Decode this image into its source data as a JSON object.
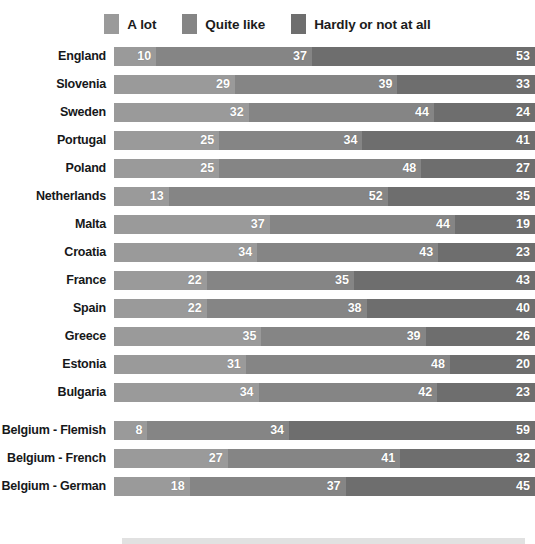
{
  "chart_data": {
    "type": "bar",
    "orientation": "horizontal",
    "stacked": true,
    "percent": true,
    "title": "",
    "subtitle": "",
    "xlabel": "",
    "ylabel": "",
    "xlim": [
      0,
      100
    ],
    "grid": false,
    "legend_position": "top-center",
    "series": [
      {
        "name": "A lot",
        "color": "#9a9a9a",
        "values": [
          10,
          29,
          32,
          25,
          25,
          13,
          37,
          34,
          22,
          22,
          35,
          31,
          34,
          8,
          27,
          18
        ]
      },
      {
        "name": "Quite like",
        "color": "#858585",
        "values": [
          37,
          39,
          44,
          34,
          48,
          52,
          44,
          43,
          35,
          38,
          39,
          48,
          42,
          34,
          41,
          37
        ]
      },
      {
        "name": "Hardly or not at all",
        "color": "#6e6e6e",
        "values": [
          53,
          33,
          24,
          41,
          27,
          35,
          19,
          23,
          43,
          40,
          26,
          20,
          23,
          59,
          32,
          45
        ]
      }
    ],
    "categories": [
      "England",
      "Slovenia",
      "Sweden",
      "Portugal",
      "Poland",
      "Netherlands",
      "Malta",
      "Croatia",
      "France",
      "Spain",
      "Greece",
      "Estonia",
      "Bulgaria",
      "Belgium - Flemish",
      "Belgium - French",
      "Belgium - German"
    ]
  },
  "legend": {
    "items": [
      {
        "label": "A lot",
        "color": "#9a9a9a",
        "swatch_name": "legend-swatch-a-lot"
      },
      {
        "label": "Quite like",
        "color": "#858585",
        "swatch_name": "legend-swatch-quite-like"
      },
      {
        "label": "Hardly or not at all",
        "color": "#6e6e6e",
        "swatch_name": "legend-swatch-hardly"
      }
    ]
  },
  "groups": [
    {
      "name": "countries",
      "rows": [
        {
          "label": "England",
          "segments": [
            {
              "value": 10,
              "color": "#9a9a9a"
            },
            {
              "value": 37,
              "color": "#858585"
            },
            {
              "value": 53,
              "color": "#6e6e6e"
            }
          ]
        },
        {
          "label": "Slovenia",
          "segments": [
            {
              "value": 29,
              "color": "#9a9a9a"
            },
            {
              "value": 39,
              "color": "#858585"
            },
            {
              "value": 33,
              "color": "#6e6e6e"
            }
          ]
        },
        {
          "label": "Sweden",
          "segments": [
            {
              "value": 32,
              "color": "#9a9a9a"
            },
            {
              "value": 44,
              "color": "#858585"
            },
            {
              "value": 24,
              "color": "#6e6e6e"
            }
          ]
        },
        {
          "label": "Portugal",
          "segments": [
            {
              "value": 25,
              "color": "#9a9a9a"
            },
            {
              "value": 34,
              "color": "#858585"
            },
            {
              "value": 41,
              "color": "#6e6e6e"
            }
          ]
        },
        {
          "label": "Poland",
          "segments": [
            {
              "value": 25,
              "color": "#9a9a9a"
            },
            {
              "value": 48,
              "color": "#858585"
            },
            {
              "value": 27,
              "color": "#6e6e6e"
            }
          ]
        },
        {
          "label": "Netherlands",
          "segments": [
            {
              "value": 13,
              "color": "#9a9a9a"
            },
            {
              "value": 52,
              "color": "#858585"
            },
            {
              "value": 35,
              "color": "#6e6e6e"
            }
          ]
        },
        {
          "label": "Malta",
          "segments": [
            {
              "value": 37,
              "color": "#9a9a9a"
            },
            {
              "value": 44,
              "color": "#858585"
            },
            {
              "value": 19,
              "color": "#6e6e6e"
            }
          ]
        },
        {
          "label": "Croatia",
          "segments": [
            {
              "value": 34,
              "color": "#9a9a9a"
            },
            {
              "value": 43,
              "color": "#858585"
            },
            {
              "value": 23,
              "color": "#6e6e6e"
            }
          ]
        },
        {
          "label": "France",
          "segments": [
            {
              "value": 22,
              "color": "#9a9a9a"
            },
            {
              "value": 35,
              "color": "#858585"
            },
            {
              "value": 43,
              "color": "#6e6e6e"
            }
          ]
        },
        {
          "label": "Spain",
          "segments": [
            {
              "value": 22,
              "color": "#9a9a9a"
            },
            {
              "value": 38,
              "color": "#858585"
            },
            {
              "value": 40,
              "color": "#6e6e6e"
            }
          ]
        },
        {
          "label": "Greece",
          "segments": [
            {
              "value": 35,
              "color": "#9a9a9a"
            },
            {
              "value": 39,
              "color": "#858585"
            },
            {
              "value": 26,
              "color": "#6e6e6e"
            }
          ]
        },
        {
          "label": "Estonia",
          "segments": [
            {
              "value": 31,
              "color": "#9a9a9a"
            },
            {
              "value": 48,
              "color": "#858585"
            },
            {
              "value": 20,
              "color": "#6e6e6e"
            }
          ]
        },
        {
          "label": "Bulgaria",
          "segments": [
            {
              "value": 34,
              "color": "#9a9a9a"
            },
            {
              "value": 42,
              "color": "#858585"
            },
            {
              "value": 23,
              "color": "#6e6e6e"
            }
          ]
        }
      ]
    },
    {
      "name": "belgium-regions",
      "rows": [
        {
          "label": "Belgium - Flemish",
          "segments": [
            {
              "value": 8,
              "color": "#9a9a9a"
            },
            {
              "value": 34,
              "color": "#858585"
            },
            {
              "value": 59,
              "color": "#6e6e6e"
            }
          ]
        },
        {
          "label": "Belgium - French",
          "segments": [
            {
              "value": 27,
              "color": "#9a9a9a"
            },
            {
              "value": 41,
              "color": "#858585"
            },
            {
              "value": 32,
              "color": "#6e6e6e"
            }
          ]
        },
        {
          "label": "Belgium - German",
          "segments": [
            {
              "value": 18,
              "color": "#9a9a9a"
            },
            {
              "value": 37,
              "color": "#858585"
            },
            {
              "value": 45,
              "color": "#6e6e6e"
            }
          ]
        }
      ]
    }
  ]
}
